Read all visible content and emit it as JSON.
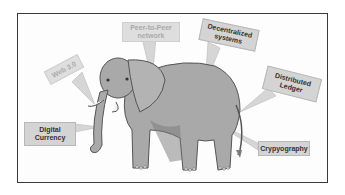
{
  "diagram": {
    "labels": [
      {
        "id": "web3",
        "text": "Web 3.0",
        "faded": true
      },
      {
        "id": "p2p",
        "text": "Peer-to-Peer network",
        "faded": true
      },
      {
        "id": "decentralized",
        "text": "Decentralized systems",
        "faded": false
      },
      {
        "id": "ledger",
        "text": "Distributed Ledger",
        "faded": false
      },
      {
        "id": "digital",
        "text": "Digital Currency",
        "faded": false
      },
      {
        "id": "crypto",
        "text": "Crypyography",
        "faded": false
      }
    ]
  },
  "colors": {
    "frame": "#3a3a3a",
    "label_bg": "#d4d4d4",
    "elephant": "#a9a9a9",
    "elephant_dark": "#7a7a7a"
  }
}
